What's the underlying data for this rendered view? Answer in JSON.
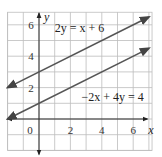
{
  "chart_data": {
    "type": "line",
    "title": "",
    "xlabel": "x",
    "ylabel": "y",
    "xlim": [
      -2,
      7.2
    ],
    "ylim": [
      -2,
      6.8
    ],
    "grid": true,
    "x_ticks": [
      0,
      2,
      4,
      6
    ],
    "x_tick_labels": [
      "0",
      "2",
      "4",
      "6"
    ],
    "y_ticks": [
      2,
      4,
      6
    ],
    "y_tick_labels": [
      "2",
      "4",
      "6"
    ],
    "series": [
      {
        "name": "2y = x + 6",
        "label": "2y = x + 6",
        "slope": 0.5,
        "intercept": 3,
        "x_range": [
          -2,
          7
        ],
        "label_position": "top-left"
      },
      {
        "name": "-2x + 4y = 4",
        "label": "−2x + 4y = 4",
        "slope": 0.5,
        "intercept": 1,
        "x_range": [
          -2,
          7
        ],
        "label_position": "middle-right"
      }
    ],
    "colors": {
      "line": "#555555",
      "grid": "#bdbdbd",
      "axis": "#2a2a2a"
    }
  }
}
